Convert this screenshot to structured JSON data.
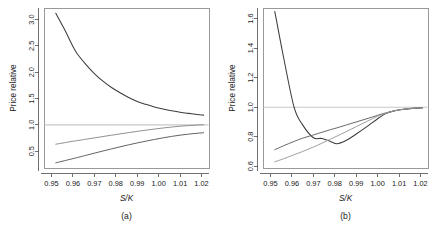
{
  "figure": {
    "panels": [
      {
        "id": "a",
        "caption": "(a)",
        "xlabel": "S/K",
        "ylabel": "Price relative"
      },
      {
        "id": "b",
        "caption": "(b)",
        "xlabel": "S/K",
        "ylabel": "Price relative"
      }
    ]
  },
  "colors": {
    "curve_dark": "#3c3c3c",
    "curve_mid": "#6e6e6e",
    "curve_light": "#9e9e9e",
    "reference_line": "#c8c8c8",
    "axis": "#4d4d4d",
    "box": "#808080",
    "background": "#ffffff"
  },
  "chart_data": [
    {
      "type": "line",
      "panel": "a",
      "title": "(a)",
      "xlabel": "S/K",
      "ylabel": "Price relative",
      "xlim": [
        0.9465,
        1.0235
      ],
      "ylim": [
        0.18,
        3.22
      ],
      "xticks": [
        0.95,
        0.96,
        0.97,
        0.98,
        0.99,
        1.0,
        1.01,
        1.02
      ],
      "xticklabels": [
        "0.95",
        "0.96",
        "0.97",
        "0.98",
        "0.99",
        "1.00",
        "1.01",
        "1.02"
      ],
      "yticks": [
        0.5,
        1.0,
        1.5,
        2.0,
        2.5,
        3.0
      ],
      "yticklabels": [
        "0.5",
        "1.0",
        "1.5",
        "2.0",
        "2.5",
        "3.0"
      ],
      "grid": false,
      "legend": "none",
      "reference_lines": [
        {
          "axis": "y",
          "value": 1.0,
          "color": "#c8c8c8"
        }
      ],
      "x": [
        0.952,
        0.956,
        0.96,
        0.962,
        0.966,
        0.97,
        0.974,
        0.978,
        0.982,
        0.986,
        0.99,
        0.994,
        0.998,
        1.002,
        1.006,
        1.01,
        1.014,
        1.018,
        1.021
      ],
      "series": [
        {
          "name": "upper-decaying",
          "color": "#3c3c3c",
          "values": [
            3.12,
            2.82,
            2.49,
            2.35,
            2.15,
            1.975,
            1.83,
            1.71,
            1.61,
            1.52,
            1.445,
            1.39,
            1.34,
            1.3,
            1.268,
            1.24,
            1.218,
            1.198,
            1.185
          ]
        },
        {
          "name": "mid-rising",
          "color": "#8a8a8a",
          "values": [
            0.632,
            0.66,
            0.688,
            0.7,
            0.726,
            0.752,
            0.778,
            0.803,
            0.828,
            0.852,
            0.876,
            0.898,
            0.92,
            0.94,
            0.958,
            0.974,
            0.986,
            0.996,
            1.002
          ]
        },
        {
          "name": "lower-rising",
          "color": "#5a5a5a",
          "values": [
            0.278,
            0.318,
            0.358,
            0.378,
            0.42,
            0.462,
            0.503,
            0.543,
            0.582,
            0.62,
            0.656,
            0.69,
            0.722,
            0.752,
            0.78,
            0.804,
            0.824,
            0.84,
            0.85
          ]
        }
      ]
    },
    {
      "type": "line",
      "panel": "b",
      "title": "(b)",
      "xlabel": "S/K",
      "ylabel": "Price relative",
      "xlim": [
        0.9465,
        1.0235
      ],
      "ylim": [
        0.588,
        1.672
      ],
      "xticks": [
        0.95,
        0.96,
        0.97,
        0.98,
        0.99,
        1.0,
        1.01,
        1.02
      ],
      "xticklabels": [
        "0.95",
        "0.96",
        "0.97",
        "0.98",
        "0.99",
        "1.00",
        "1.01",
        "1.02"
      ],
      "yticks": [
        0.6,
        0.8,
        1.0,
        1.2,
        1.4,
        1.6
      ],
      "yticklabels": [
        "0.6",
        "0.8",
        "1.0",
        "1.2",
        "1.4",
        "1.6"
      ],
      "grid": false,
      "legend": "none",
      "reference_lines": [
        {
          "axis": "y",
          "value": 1.0,
          "color": "#c8c8c8"
        }
      ],
      "x": [
        0.952,
        0.956,
        0.961,
        0.965,
        0.97,
        0.974,
        0.978,
        0.981,
        0.985,
        0.99,
        0.995,
        1.0,
        1.004,
        1.008,
        1.012,
        1.016,
        1.021
      ],
      "series": [
        {
          "name": "steep-dip",
          "color": "#3c3c3c",
          "values": [
            1.648,
            1.345,
            1.0,
            0.88,
            0.793,
            0.788,
            0.768,
            0.752,
            0.772,
            0.818,
            0.868,
            0.922,
            0.958,
            0.976,
            0.986,
            0.992,
            0.996
          ]
        },
        {
          "name": "mid-rising",
          "color": "#5f5f5f",
          "values": [
            0.712,
            0.738,
            0.768,
            0.79,
            0.812,
            0.83,
            0.848,
            0.86,
            0.878,
            0.9,
            0.922,
            0.945,
            0.962,
            0.976,
            0.985,
            0.991,
            0.996
          ]
        },
        {
          "name": "light-rising",
          "color": "#9a9a9a",
          "values": [
            0.63,
            0.65,
            0.678,
            0.7,
            0.73,
            0.756,
            0.784,
            0.804,
            0.832,
            0.868,
            0.904,
            0.938,
            0.96,
            0.976,
            0.986,
            0.992,
            0.997
          ]
        }
      ]
    }
  ]
}
